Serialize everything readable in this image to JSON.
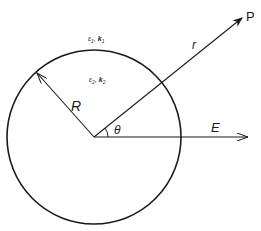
{
  "diagram": {
    "title": "",
    "type": "sphere-in-uniform-field",
    "labels": {
      "point": "P",
      "r": "r",
      "R": "R",
      "theta": "θ",
      "E": "E",
      "outside_eps": "ε",
      "outside_eps_sub": "1",
      "outside_k": "k",
      "outside_k_sub": "1",
      "inside_eps": "ε",
      "inside_eps_sub": "2",
      "inside_k": "k",
      "inside_k_sub": "2",
      "separator": ","
    },
    "geometry": {
      "center": [
        94,
        137
      ],
      "radius": 87,
      "R_tip": [
        37,
        73
      ],
      "P_tip": [
        242,
        17
      ],
      "E_tip": [
        248,
        137
      ]
    },
    "colors": {
      "stroke": "#1a1a1a",
      "background": "#ffffff"
    }
  }
}
